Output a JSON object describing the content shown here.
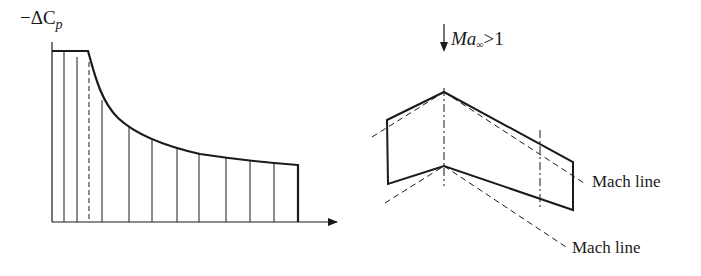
{
  "left_chart": {
    "ylabel_prefix": "−ΔC",
    "ylabel_sub": "p",
    "description": "Chordwise pressure difference distribution with flat plateau then decaying curve"
  },
  "right_diagram": {
    "flow_label_main": "Ma",
    "flow_label_sub": "∞",
    "flow_label_rest": ">1",
    "mach_line_label_1": "Mach line",
    "mach_line_label_2": "Mach line"
  },
  "colors": {
    "stroke": "#1a1a1a",
    "background": "#ffffff"
  }
}
